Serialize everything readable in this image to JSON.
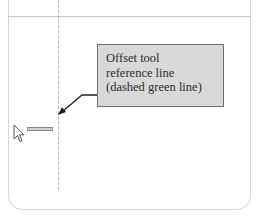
{
  "callout": {
    "lines": [
      "Offset tool",
      "reference line",
      "(dashed green line)"
    ]
  },
  "icons": {
    "cursor": "arrow-cursor-icon",
    "pointer_arrow": "callout-arrow-icon"
  },
  "colors": {
    "callout_bg": "#d9d9d9",
    "callout_border": "#6f6f6f",
    "reference_line": "#b5b5b5"
  }
}
